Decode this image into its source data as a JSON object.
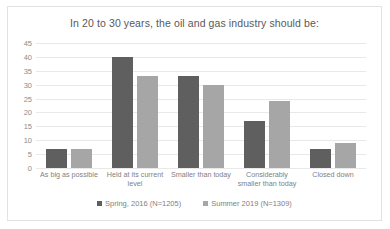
{
  "chart_data": {
    "type": "bar",
    "title": "In 20 to 30 years, the oil and gas industry should be:",
    "xlabel": "",
    "ylabel": "",
    "ylim": [
      0,
      45
    ],
    "yticks": [
      45,
      40,
      35,
      30,
      25,
      20,
      15,
      10,
      5,
      0
    ],
    "grid": true,
    "legend_position": "bottom",
    "categories": [
      "As big as possible",
      "Held at its current level",
      "Smaller than today",
      "Considerably smaller than today",
      "Closed down"
    ],
    "series": [
      {
        "name": "Spring, 2016 (N=1205)",
        "color": "#5f5f5f",
        "values": [
          7,
          40,
          33,
          17,
          7
        ]
      },
      {
        "name": "Summer 2019 (N=1309)",
        "color": "#a6a6a6",
        "values": [
          7,
          33,
          30,
          24,
          9
        ]
      }
    ]
  }
}
